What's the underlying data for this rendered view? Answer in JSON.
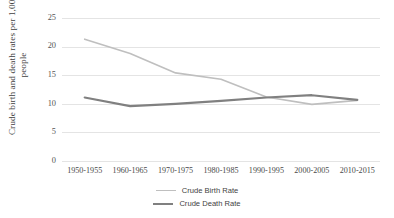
{
  "chart_data": {
    "type": "line",
    "title": "",
    "xlabel": "",
    "ylabel": "Crude birth and death rates per 1,000 people",
    "categories": [
      "1950-1955",
      "1960-1965",
      "1970-1975",
      "1980-1985",
      "1990-1995",
      "2000-2005",
      "2010-2015"
    ],
    "series": [
      {
        "name": "Crude Birth Rate",
        "color": "#bfbfbf",
        "values": [
          21.3,
          18.8,
          15.4,
          14.3,
          11.2,
          9.9,
          10.6
        ]
      },
      {
        "name": "Crude Death Rate",
        "color": "#808080",
        "values": [
          11.1,
          9.6,
          10.0,
          10.5,
          11.1,
          11.5,
          10.7
        ]
      }
    ],
    "ylim": [
      0,
      25
    ],
    "yticks": [
      0,
      5,
      10,
      15,
      20,
      25
    ],
    "ytick_labels": [
      "0",
      "5",
      "10",
      "15",
      "20",
      "25"
    ],
    "grid": true,
    "legend_position": "bottom"
  },
  "axis": {
    "y_title_line1": "Crude birth and death rates per 1,000",
    "y_title_line2": "people"
  },
  "legend": {
    "items": [
      {
        "label": "Crude Birth Rate",
        "color": "#bfbfbf",
        "width": "1.6px"
      },
      {
        "label": "Crude Death Rate",
        "color": "#808080",
        "width": "2.2px"
      }
    ]
  },
  "colors": {
    "gridline": "#e4e4e4",
    "background": "#ffffff",
    "text": "#404040"
  }
}
